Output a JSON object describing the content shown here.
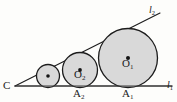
{
  "figure": {
    "kind": "plane-geometry-diagram",
    "background_color": "#fdfdfb",
    "stroke_color": "#1c1c1c",
    "circle_fill_color": "#d9d9d9",
    "labels": {
      "vertex": "C",
      "center_large": "O",
      "center_large_sub": "1",
      "center_middle": "O",
      "center_middle_sub": "2",
      "foot_large": "A",
      "foot_large_sub": "1",
      "foot_middle": "A",
      "foot_middle_sub": "2",
      "line_lower": "l",
      "line_lower_sub": "1",
      "line_upper": "l",
      "line_upper_sub": "2"
    },
    "geometry": {
      "vertex_point": {
        "x": 15,
        "y": 86
      },
      "ray_lower_end": {
        "x": 172,
        "y": 86
      },
      "ray_upper_end": {
        "x": 160,
        "y": 13
      },
      "circles": [
        {
          "name": "small-circle",
          "cx": 48,
          "cy": 76,
          "r": 12,
          "labeled": false
        },
        {
          "name": "circle-O2",
          "cx": 80,
          "cy": 70,
          "r": 18,
          "labeled": true
        },
        {
          "name": "circle-O1",
          "cx": 128,
          "cy": 58,
          "r": 30,
          "labeled": true
        }
      ],
      "tangent_feet": [
        {
          "name": "A2",
          "x": 80,
          "y": 86
        },
        {
          "name": "A1",
          "x": 128,
          "y": 86
        }
      ],
      "center_dots": [
        {
          "x": 48,
          "y": 76
        },
        {
          "x": 80,
          "y": 70
        },
        {
          "x": 128,
          "y": 58
        }
      ]
    }
  }
}
